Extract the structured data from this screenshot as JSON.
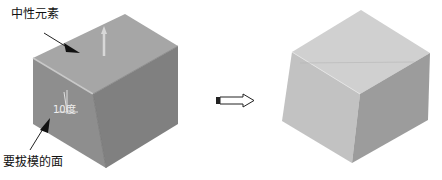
{
  "diagram": {
    "left_cube": {
      "label_neutral": "中性元素",
      "label_face": "要拔模的面",
      "angle_label": "10度"
    },
    "transition_arrow": "right-arrow",
    "right_cube": {
      "description": "drafted cube result"
    },
    "colors": {
      "left_top": "#a4a4a4",
      "left_left": "#8c8c8c",
      "left_right": "#7d7d7d",
      "right_top": "#cfcfcf",
      "right_left": "#c0c0c0",
      "right_right": "#9a9a9a"
    }
  }
}
